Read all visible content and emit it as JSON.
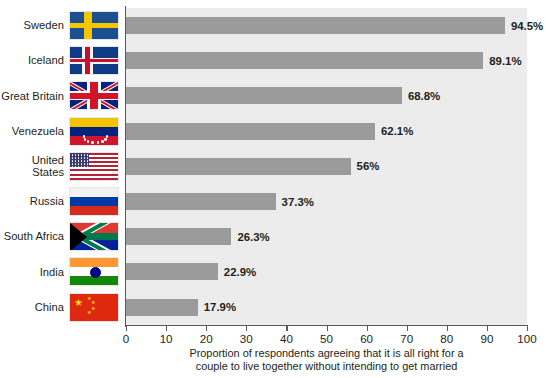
{
  "chart_data": {
    "type": "bar",
    "orientation": "horizontal",
    "title": "",
    "xlabel": "Proportion of respondents agreeing that it is all right for a couple to live together without intending to get married",
    "ylabel": "",
    "xlim": [
      0,
      100
    ],
    "grid": false,
    "legend": "none",
    "bar_color": "#9b9b9b",
    "plot_background": "#ececec",
    "categories": [
      "Sweden",
      "Iceland",
      "Great Britain",
      "Venezuela",
      "United\nStates",
      "Russia",
      "South Africa",
      "India",
      "China"
    ],
    "values": [
      94.5,
      89.1,
      68.8,
      62.1,
      56,
      37.3,
      26.3,
      22.9,
      17.9
    ],
    "value_labels": [
      "94.5%",
      "89.1%",
      "68.8%",
      "62.1%",
      "56%",
      "37.3%",
      "26.3%",
      "22.9%",
      "17.9%"
    ],
    "flags": [
      "sweden",
      "iceland",
      "great-britain",
      "venezuela",
      "united-states",
      "russia",
      "south-africa",
      "india",
      "china"
    ],
    "xticks": [
      0,
      10,
      20,
      30,
      40,
      50,
      60,
      70,
      80,
      90,
      100
    ],
    "xtick_labels": [
      "0",
      "10",
      "20",
      "30",
      "40",
      "50",
      "60",
      "70",
      "80",
      "90",
      "100"
    ]
  },
  "caption": {
    "line1": "Proportion of respondents agreeing that it is all right for a",
    "line2": "couple to live together without intending to get married"
  }
}
